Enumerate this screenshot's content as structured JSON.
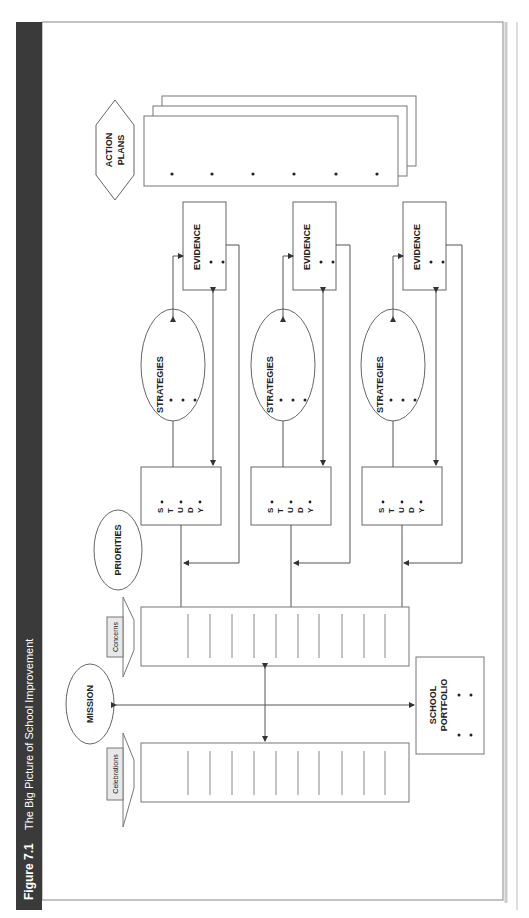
{
  "figure": {
    "number": "Figure 7.1",
    "title": "The Big Picture of School Improvement",
    "header_bg": "#3a3a3a",
    "header_text_color": "#ffffff"
  },
  "diagram": {
    "action_plans": {
      "line1": "ACTION",
      "line2": "PLANS",
      "bullets": 6
    },
    "columns": [
      {
        "evidence": "EVIDENCE",
        "strategies": "STRATEGIES",
        "study": [
          "S",
          "T",
          "U",
          "D",
          "Y"
        ]
      },
      {
        "evidence": "EVIDENCE",
        "strategies": "STRATEGIES",
        "study": [
          "S",
          "T",
          "U",
          "D",
          "Y"
        ]
      },
      {
        "evidence": "EVIDENCE",
        "strategies": "STRATEGIES",
        "study": [
          "S",
          "T",
          "U",
          "D",
          "Y"
        ]
      }
    ],
    "priorities": "PRIORITIES",
    "mission": "MISSION",
    "concerns_tab": "Concerns",
    "celebrations_tab": "Celebrations",
    "school_portfolio": {
      "line1": "SCHOOL",
      "line2": "PORTFOLIO"
    },
    "concerns_cells": 11,
    "celebrations_cells": 11,
    "line_color": "#555555"
  }
}
